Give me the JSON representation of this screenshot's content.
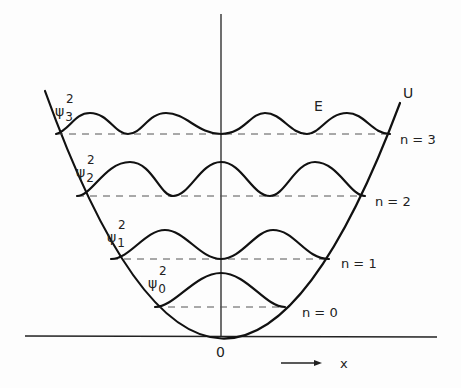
{
  "diagram": {
    "potential_label": "U",
    "energy_label": "E",
    "origin_label": "0",
    "x_axis_label": "x",
    "levels": [
      {
        "n": 0,
        "state_label": "n = 0",
        "psi_label": "ψ",
        "psi_sub": "0",
        "psi_sup": "2"
      },
      {
        "n": 1,
        "state_label": "n = 1",
        "psi_label": "ψ",
        "psi_sub": "1",
        "psi_sup": "2"
      },
      {
        "n": 2,
        "state_label": "n = 2",
        "psi_label": "ψ",
        "psi_sub": "2",
        "psi_sup": "2"
      },
      {
        "n": 3,
        "state_label": "n = 3",
        "psi_label": "ψ",
        "psi_sub": "3",
        "psi_sup": "2"
      }
    ]
  }
}
